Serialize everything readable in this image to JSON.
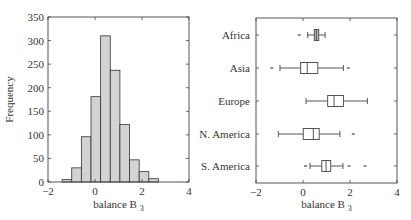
{
  "chart_data": [
    {
      "type": "bar",
      "subtype": "histogram",
      "title": "",
      "xlabel": "balance B",
      "xlabel_subscript": "3",
      "ylabel": "Frequency",
      "xlim": [
        -2,
        4
      ],
      "ylim": [
        0,
        350
      ],
      "xticks": [
        -2,
        0,
        2,
        4
      ],
      "yticks": [
        0,
        50,
        100,
        150,
        200,
        250,
        300,
        350
      ],
      "grid": false,
      "bin_edges": [
        -1.4,
        -0.99,
        -0.58,
        -0.17,
        0.24,
        0.65,
        1.06,
        1.47,
        1.88,
        2.29,
        2.7
      ],
      "values": [
        5,
        30,
        96,
        181,
        310,
        237,
        122,
        47,
        22,
        7
      ],
      "bar_color": "#d3d3d3",
      "edge_color": "#333333"
    },
    {
      "type": "boxplot",
      "orientation": "horizontal",
      "title": "",
      "xlabel": "balance B",
      "xlabel_subscript": "3",
      "ylabel": "",
      "xlim": [
        -2,
        4
      ],
      "xticks": [
        -2,
        0,
        2,
        4
      ],
      "grid": false,
      "categories": [
        "Africa",
        "Asia",
        "Europe",
        "N. America",
        "S. America"
      ],
      "series": [
        {
          "name": "Africa",
          "whisker_low": 0.2,
          "q1": 0.48,
          "median": 0.57,
          "q3": 0.67,
          "whisker_high": 0.94,
          "outliers": [
            -0.16
          ],
          "fill": "#bdbdbd"
        },
        {
          "name": "Asia",
          "whisker_low": -0.98,
          "q1": -0.1,
          "median": 0.18,
          "q3": 0.63,
          "whisker_high": 1.72,
          "outliers": [
            -1.33,
            1.93
          ],
          "fill": "#ffffff"
        },
        {
          "name": "Europe",
          "whisker_low": 0.13,
          "q1": 1.05,
          "median": 1.32,
          "q3": 1.72,
          "whisker_high": 2.74,
          "outliers": [],
          "fill": "#ffffff"
        },
        {
          "name": "N. America",
          "whisker_low": -1.05,
          "q1": 0.01,
          "median": 0.44,
          "q3": 0.69,
          "whisker_high": 1.57,
          "outliers": [
            2.14
          ],
          "fill": "#ffffff"
        },
        {
          "name": "S. America",
          "whisker_low": 0.3,
          "q1": 0.8,
          "median": 0.98,
          "q3": 1.18,
          "whisker_high": 1.7,
          "outliers": [
            0.11,
            1.96,
            2.64
          ],
          "fill": "#ffffff"
        }
      ]
    }
  ]
}
